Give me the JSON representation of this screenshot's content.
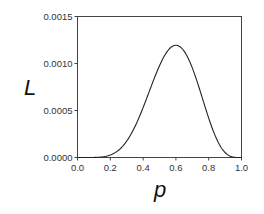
{
  "chart_data": {
    "type": "line",
    "title": "",
    "xlabel": "p",
    "ylabel": "L",
    "xlim": [
      0.0,
      1.0
    ],
    "ylim": [
      0.0,
      0.0015
    ],
    "x_ticks": [
      "0.0",
      "0.2",
      "0.4",
      "0.6",
      "0.8",
      "1.0"
    ],
    "y_ticks": [
      "0.0000",
      "0.0005",
      "0.0010",
      "0.0015"
    ],
    "grid": false,
    "legend": null,
    "series": [
      {
        "name": "likelihood",
        "formula": "p^6 (1-p)^4",
        "x": [
          0.0,
          0.1,
          0.2,
          0.3,
          0.4,
          0.5,
          0.6,
          0.7,
          0.8,
          0.9,
          1.0
        ],
        "values": [
          0.0,
          7e-07,
          2.62e-05,
          0.000175,
          0.0005308,
          0.0009766,
          0.0011944,
          0.000953,
          0.0004194,
          5.31e-05,
          0.0
        ]
      }
    ]
  }
}
